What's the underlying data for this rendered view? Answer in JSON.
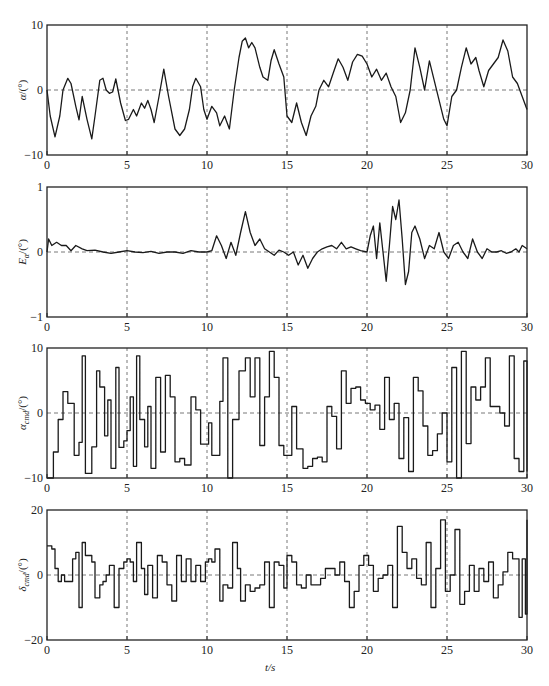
{
  "figure": {
    "xlabel": "t/s",
    "xticks": [
      "0",
      "5",
      "10",
      "15",
      "20",
      "25",
      "30"
    ]
  },
  "chart_data": [
    {
      "type": "line",
      "ylabel": "α/(°)",
      "ylabel_main": "α",
      "ylabel_unit": "/(°)",
      "xlabel": "t/s",
      "xlim": [
        0,
        30
      ],
      "ylim": [
        -10,
        10
      ],
      "yticks": [
        "10",
        "0",
        "−10"
      ],
      "xticks": [
        "0",
        "5",
        "10",
        "15",
        "20",
        "25",
        "30"
      ],
      "grid": "dashed vertical at 5,10,15,20,25; dashed horizontal at 0",
      "x": [
        0,
        0.2,
        0.5,
        0.8,
        1.0,
        1.3,
        1.5,
        1.8,
        2.0,
        2.2,
        2.5,
        2.8,
        3.0,
        3.3,
        3.5,
        3.7,
        3.9,
        4.1,
        4.3,
        4.6,
        4.9,
        5.1,
        5.4,
        5.6,
        5.9,
        6.1,
        6.3,
        6.5,
        6.7,
        7.0,
        7.3,
        7.6,
        8.0,
        8.3,
        8.6,
        8.9,
        9.1,
        9.3,
        9.6,
        9.8,
        10.0,
        10.3,
        10.6,
        10.8,
        11.1,
        11.4,
        11.7,
        12.0,
        12.2,
        12.4,
        12.6,
        12.8,
        13.0,
        13.3,
        13.5,
        13.8,
        14.0,
        14.2,
        14.5,
        14.8,
        15.0,
        15.3,
        15.6,
        15.9,
        16.2,
        16.5,
        16.8,
        17.0,
        17.3,
        17.6,
        17.9,
        18.2,
        18.5,
        18.8,
        19.1,
        19.4,
        19.7,
        20.0,
        20.3,
        20.6,
        20.9,
        21.2,
        21.5,
        21.8,
        22.1,
        22.4,
        22.7,
        23.0,
        23.3,
        23.6,
        23.9,
        24.2,
        24.5,
        24.8,
        25.0,
        25.3,
        25.6,
        25.9,
        26.2,
        26.5,
        26.8,
        27.0,
        27.3,
        27.6,
        27.9,
        28.2,
        28.5,
        28.8,
        29.1,
        29.4,
        29.7,
        30.0
      ],
      "values": [
        0,
        -4,
        -7.2,
        -4,
        0,
        1.8,
        1,
        -2.5,
        -4.6,
        -1,
        -4.5,
        -7.5,
        -4,
        1.5,
        1.8,
        0,
        -0.5,
        -0.3,
        1.7,
        -2,
        -4.7,
        -4.5,
        -3,
        -4,
        -2,
        -2.8,
        -1.6,
        -3,
        -5,
        -1,
        3.2,
        -1,
        -6,
        -7,
        -6,
        -3,
        0.5,
        1.8,
        0.5,
        -3,
        -4.5,
        -2.5,
        -3.5,
        -5.5,
        -4,
        -6,
        0,
        5,
        7.5,
        8,
        6.5,
        7.3,
        6.5,
        3.5,
        2,
        1.5,
        4.5,
        6.2,
        4,
        2,
        -4,
        -5,
        -2,
        -5,
        -7,
        -4,
        -2.5,
        0,
        1.5,
        0.5,
        2.7,
        4.8,
        3.5,
        1.5,
        4.3,
        5.5,
        5.2,
        4,
        2,
        3.2,
        1.5,
        2.6,
        0.5,
        -1,
        -5,
        -3.5,
        0,
        6.5,
        3.5,
        0,
        4.5,
        1.5,
        -1.5,
        -4.5,
        -5.5,
        -1,
        0,
        3.5,
        6.5,
        4,
        5,
        3,
        0.5,
        3,
        4,
        5,
        7.7,
        6,
        2,
        1,
        -1,
        -3,
        -4
      ]
    },
    {
      "type": "line",
      "ylabel": "E_α/(°)",
      "ylabel_main": "E",
      "ylabel_sub": "α",
      "ylabel_unit": "/(°)",
      "xlabel": "t/s",
      "xlim": [
        0,
        30
      ],
      "ylim": [
        -1,
        1
      ],
      "yticks": [
        "1",
        "0",
        "−1"
      ],
      "xticks": [
        "0",
        "5",
        "10",
        "15",
        "20",
        "25",
        "30"
      ],
      "x": [
        0,
        0.1,
        0.3,
        0.6,
        0.9,
        1.2,
        1.5,
        1.8,
        2.2,
        2.5,
        3.0,
        3.5,
        4.0,
        4.5,
        5.0,
        5.5,
        6.0,
        6.5,
        7.0,
        7.5,
        8.0,
        8.5,
        9.0,
        9.5,
        10.0,
        10.3,
        10.6,
        10.9,
        11.2,
        11.5,
        11.8,
        12.1,
        12.4,
        12.7,
        13.0,
        13.3,
        13.6,
        13.9,
        14.2,
        14.5,
        14.8,
        15.1,
        15.4,
        15.7,
        16.0,
        16.3,
        16.6,
        16.9,
        17.2,
        17.5,
        17.8,
        18.1,
        18.4,
        18.7,
        19.0,
        19.3,
        19.6,
        20.0,
        20.2,
        20.4,
        20.6,
        20.8,
        21.0,
        21.2,
        21.4,
        21.6,
        21.8,
        22.0,
        22.2,
        22.4,
        22.6,
        22.8,
        23.0,
        23.3,
        23.6,
        23.9,
        24.2,
        24.5,
        24.8,
        25.1,
        25.4,
        25.7,
        26.0,
        26.3,
        26.6,
        26.9,
        27.2,
        27.5,
        27.8,
        28.1,
        28.4,
        28.7,
        29.0,
        29.3,
        29.5,
        29.7,
        30.0
      ],
      "values": [
        0,
        0.2,
        0.1,
        0.15,
        0.1,
        0.1,
        0.02,
        0.1,
        0.05,
        0.02,
        0.03,
        0.0,
        -0.02,
        0.0,
        0.02,
        0.0,
        -0.01,
        0.01,
        -0.02,
        0.0,
        0.0,
        -0.02,
        0.02,
        0.0,
        0.0,
        0.02,
        0.25,
        0.1,
        -0.1,
        0.15,
        -0.05,
        0.3,
        0.62,
        0.3,
        0.1,
        0.2,
        0.05,
        0.0,
        -0.05,
        0.03,
        0.0,
        -0.05,
        0.0,
        -0.2,
        -0.05,
        -0.25,
        -0.1,
        0.0,
        0.05,
        0.08,
        0.1,
        0.05,
        0.15,
        0.05,
        0.08,
        0.05,
        0.02,
        0.0,
        0.25,
        0.4,
        -0.1,
        0.45,
        0.0,
        -0.45,
        0.1,
        0.7,
        0.5,
        0.8,
        0.2,
        -0.5,
        -0.3,
        0.3,
        0.4,
        0.2,
        -0.1,
        0.1,
        0.05,
        0.3,
        0.0,
        -0.1,
        0.1,
        0.15,
        0.0,
        -0.1,
        0.2,
        0.0,
        -0.1,
        0.05,
        0.0,
        0.0,
        0.02,
        -0.02,
        0.0,
        0.05,
        0.0,
        0.1,
        0.05
      ]
    },
    {
      "type": "line",
      "step": true,
      "ylabel": "α_cmd/(°)",
      "ylabel_main": "α",
      "ylabel_sub": "cmd",
      "ylabel_unit": "/(°)",
      "xlabel": "t/s",
      "xlim": [
        0,
        30
      ],
      "ylim": [
        -10,
        10
      ],
      "yticks": [
        "10",
        "0",
        "−10"
      ],
      "xticks": [
        "0",
        "5",
        "10",
        "15",
        "20",
        "25",
        "30"
      ],
      "x": [
        0,
        0.4,
        0.7,
        1.0,
        1.3,
        1.7,
        2.0,
        2.2,
        2.4,
        2.6,
        2.8,
        3.1,
        3.3,
        3.6,
        3.8,
        4.0,
        4.3,
        4.5,
        4.8,
        5.0,
        5.2,
        5.4,
        5.6,
        5.8,
        6.1,
        6.3,
        6.5,
        6.8,
        7.1,
        7.4,
        7.7,
        8.0,
        8.3,
        8.6,
        9.0,
        9.3,
        9.6,
        9.9,
        10.1,
        10.3,
        10.6,
        10.8,
        11.0,
        11.3,
        11.6,
        12.0,
        12.4,
        12.7,
        13.0,
        13.3,
        13.6,
        13.9,
        14.2,
        14.5,
        14.8,
        15.0,
        15.3,
        15.6,
        16.0,
        16.3,
        16.6,
        16.9,
        17.2,
        17.5,
        17.8,
        18.1,
        18.4,
        18.7,
        19.0,
        19.3,
        19.6,
        19.9,
        20.2,
        20.5,
        20.8,
        21.1,
        21.4,
        21.7,
        22.0,
        22.3,
        22.6,
        22.9,
        23.2,
        23.5,
        23.8,
        24.1,
        24.4,
        24.7,
        25.0,
        25.3,
        25.6,
        25.9,
        26.2,
        26.5,
        26.8,
        27.1,
        27.4,
        27.7,
        28.0,
        28.3,
        28.6,
        28.9,
        29.2,
        29.5,
        29.8,
        30.0
      ],
      "values": [
        -10,
        -6,
        -1,
        3.3,
        1.5,
        -6.5,
        -4.5,
        8.8,
        -9.3,
        -9.3,
        -5.2,
        6.5,
        4,
        -3.5,
        2,
        -8.5,
        7,
        -5.3,
        -4.3,
        -2.7,
        2.5,
        -8.2,
        8.8,
        -1,
        -5.2,
        1,
        -8.5,
        5.5,
        -6,
        5.8,
        2.5,
        -7.5,
        -7,
        -8,
        2.5,
        0.5,
        -4.8,
        -4.8,
        -1.5,
        -6.5,
        -6.5,
        1.8,
        8.5,
        -10,
        -1,
        6.5,
        8.5,
        2.5,
        8.5,
        -5,
        2.5,
        9.5,
        5.5,
        -5,
        -6.5,
        -6.5,
        1,
        -5.5,
        -8.5,
        -8.2,
        -7,
        -6.8,
        -7.5,
        1,
        -0.5,
        -5.5,
        6.5,
        1.5,
        3.8,
        4,
        2,
        1.5,
        0.5,
        1.2,
        -2.5,
        5.5,
        -1,
        1.5,
        -7,
        -0.7,
        -9,
        5.5,
        3.4,
        -2,
        -6.5,
        -5.8,
        -3.2,
        0,
        -7.5,
        7,
        -10,
        9.5,
        -4.7,
        4,
        2,
        4,
        8.5,
        1,
        1,
        0,
        -2,
        8.8,
        -7,
        -9,
        8,
        -9
      ]
    },
    {
      "type": "line",
      "step": true,
      "ylabel": "δ_cmd/(°)",
      "ylabel_main": "δ",
      "ylabel_sub": "cmd",
      "ylabel_unit": "/(°)",
      "xlabel": "t/s",
      "xlim": [
        0,
        30
      ],
      "ylim": [
        -20,
        20
      ],
      "yticks": [
        "20",
        "0",
        "−20"
      ],
      "xticks": [
        "0",
        "5",
        "10",
        "15",
        "20",
        "25",
        "30"
      ],
      "x": [
        0,
        0.3,
        0.5,
        0.7,
        0.9,
        1.1,
        1.3,
        1.6,
        1.8,
        2.0,
        2.2,
        2.4,
        2.6,
        2.8,
        3.0,
        3.3,
        3.5,
        3.7,
        3.9,
        4.2,
        4.5,
        4.8,
        5.0,
        5.2,
        5.4,
        5.6,
        5.9,
        6.1,
        6.3,
        6.6,
        6.9,
        7.2,
        7.5,
        7.8,
        8.1,
        8.4,
        8.7,
        9.0,
        9.3,
        9.6,
        9.9,
        10.1,
        10.3,
        10.5,
        10.8,
        11.0,
        11.3,
        11.6,
        11.9,
        12.1,
        12.4,
        12.7,
        13.0,
        13.3,
        13.6,
        13.9,
        14.2,
        14.5,
        14.8,
        15.0,
        15.3,
        15.6,
        15.9,
        16.2,
        16.5,
        16.8,
        17.1,
        17.4,
        17.7,
        18.0,
        18.3,
        18.6,
        18.9,
        19.2,
        19.5,
        19.8,
        20.1,
        20.4,
        20.7,
        21.0,
        21.3,
        21.6,
        21.9,
        22.2,
        22.5,
        22.8,
        23.1,
        23.4,
        23.7,
        24.0,
        24.3,
        24.6,
        24.9,
        25.2,
        25.5,
        25.8,
        26.1,
        26.4,
        26.7,
        27.0,
        27.3,
        27.6,
        27.9,
        28.2,
        28.5,
        28.8,
        29.1,
        29.3,
        29.5,
        29.7,
        29.9,
        30.0
      ],
      "values": [
        9,
        8,
        2,
        -2,
        0,
        -2,
        -2,
        5,
        7,
        -10,
        10,
        6,
        6,
        4,
        -7,
        -3,
        -2,
        0,
        3,
        -10,
        2,
        4,
        5,
        4,
        -2,
        10,
        2,
        -6,
        3,
        -7,
        6,
        4,
        -3,
        -8,
        6,
        -2,
        5,
        -2,
        3,
        -2,
        4,
        5,
        4,
        8,
        -8,
        -3,
        -4,
        10,
        2,
        -8,
        -3,
        -5,
        -4,
        -3,
        4,
        -10,
        4,
        3,
        -4,
        6,
        4,
        -3,
        -4,
        0,
        -3,
        -3,
        -1,
        2,
        2,
        0,
        4,
        -2,
        -10,
        -5,
        3,
        6,
        3,
        -5,
        -1,
        0,
        3,
        -10,
        15,
        7,
        2,
        5,
        -1,
        -3,
        10,
        -10,
        2,
        17,
        -5,
        0,
        14,
        -9,
        -5,
        3,
        -5,
        2,
        -2,
        4,
        -7,
        -3,
        1,
        7,
        5,
        5,
        -13,
        5,
        -12,
        17
      ]
    }
  ]
}
